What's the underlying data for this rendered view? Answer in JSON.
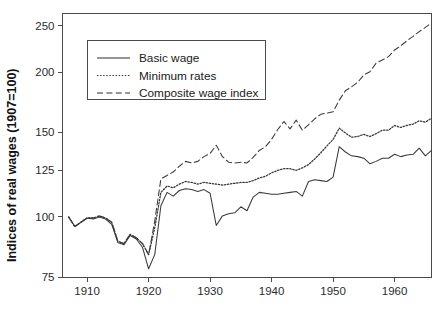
{
  "chart_data": {
    "type": "line",
    "title": "",
    "xlabel": "",
    "ylabel": "Indices of real wages (1907=100)",
    "yscale": "log",
    "ylim": [
      75,
      265
    ],
    "xlim": [
      1906,
      1966
    ],
    "grid": false,
    "legend_position": "upper-left",
    "ytick_labels": [
      "75",
      "100",
      "125",
      "150",
      "200",
      "250"
    ],
    "ytick_values": [
      75,
      100,
      125,
      150,
      200,
      250
    ],
    "xtick_labels": [
      "1910",
      "1920",
      "1930",
      "1940",
      "1950",
      "1960"
    ],
    "xtick_values": [
      1910,
      1920,
      1930,
      1940,
      1950,
      1960
    ],
    "x": [
      1907,
      1908,
      1909,
      1910,
      1911,
      1912,
      1913,
      1914,
      1915,
      1916,
      1917,
      1918,
      1919,
      1920,
      1921,
      1922,
      1923,
      1924,
      1925,
      1926,
      1927,
      1928,
      1929,
      1930,
      1931,
      1932,
      1933,
      1934,
      1935,
      1936,
      1937,
      1938,
      1939,
      1940,
      1941,
      1942,
      1943,
      1944,
      1945,
      1946,
      1947,
      1948,
      1949,
      1950,
      1951,
      1952,
      1953,
      1954,
      1955,
      1956,
      1957,
      1958,
      1959,
      1960,
      1961,
      1962,
      1963,
      1964,
      1965,
      1966
    ],
    "series": [
      {
        "name": "Basic wage",
        "style": "solid",
        "values": [
          100,
          95.5,
          97.5,
          99.5,
          99.0,
          100.0,
          99.0,
          96.5,
          88.5,
          87.5,
          91.5,
          90.0,
          86.5,
          78.0,
          83.5,
          105.5,
          112.5,
          110.5,
          113.5,
          114.5,
          114.0,
          113.0,
          114.0,
          112.0,
          96.0,
          100.5,
          101.5,
          102.0,
          105.0,
          103.0,
          110.0,
          112.5,
          112.0,
          111.5,
          111.5,
          112.0,
          112.5,
          113.0,
          110.5,
          118.5,
          119.5,
          119.0,
          118.5,
          121.0,
          140.0,
          136.5,
          134.0,
          133.5,
          132.5,
          129.0,
          130.5,
          132.5,
          132.5,
          135.0,
          133.5,
          134.5,
          135.0,
          139.0,
          134.0,
          137.5
        ]
      },
      {
        "name": "Minimum rates",
        "style": "dotted",
        "values": [
          100,
          95.5,
          97.5,
          99.5,
          99.5,
          100.5,
          99.5,
          97.5,
          89.0,
          88.0,
          92.0,
          90.5,
          88.0,
          83.5,
          95.0,
          112.5,
          116.0,
          115.0,
          117.0,
          118.5,
          118.0,
          117.0,
          118.0,
          117.5,
          117.0,
          116.5,
          117.0,
          117.5,
          118.0,
          118.0,
          119.0,
          120.5,
          121.5,
          123.5,
          125.0,
          126.0,
          126.0,
          125.0,
          126.5,
          128.5,
          132.0,
          136.0,
          140.5,
          145.0,
          153.0,
          149.5,
          146.5,
          147.0,
          148.5,
          147.0,
          149.0,
          151.5,
          151.5,
          155.0,
          153.5,
          155.0,
          156.0,
          158.5,
          157.5,
          160.5
        ]
      },
      {
        "name": "Composite wage index",
        "style": "dashed",
        "values": [
          100,
          95.5,
          97.5,
          99.5,
          99.5,
          100.5,
          99.5,
          97.5,
          89.0,
          88.0,
          92.0,
          90.5,
          88.0,
          83.5,
          98.0,
          120.0,
          122.0,
          124.0,
          127.5,
          130.5,
          129.5,
          130.5,
          133.5,
          135.5,
          141.0,
          133.5,
          130.0,
          129.5,
          130.0,
          129.5,
          133.0,
          137.5,
          140.0,
          145.0,
          152.0,
          158.0,
          152.5,
          159.0,
          151.5,
          155.5,
          160.0,
          163.5,
          164.5,
          165.5,
          175.0,
          183.0,
          186.5,
          190.5,
          197.5,
          200.5,
          209.0,
          212.0,
          215.5,
          222.5,
          227.0,
          232.5,
          237.5,
          243.0,
          248.0,
          253.0
        ]
      }
    ]
  },
  "legend": {
    "items": [
      {
        "label": "Basic wage",
        "style": "solid"
      },
      {
        "label": "Minimum rates",
        "style": "dotted"
      },
      {
        "label": "Composite wage index",
        "style": "dashed"
      }
    ]
  },
  "axes": {
    "y_title": "Indices of real wages (1907=100)"
  }
}
